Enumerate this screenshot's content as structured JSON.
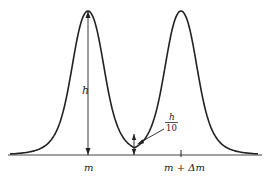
{
  "diagram": {
    "labels": {
      "peak_height": "h",
      "valley_num": "h",
      "valley_den": "10",
      "mass_left": "m",
      "mass_right": "m + Δm"
    },
    "colors": {
      "stroke": "#222222",
      "background": "#ffffff"
    },
    "valley_fraction_of_height": 0.1
  }
}
